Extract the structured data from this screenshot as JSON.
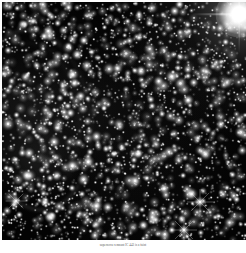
{
  "page": {
    "background_color": "#ffffff",
    "kind": "astronomical-photograph-plate"
  },
  "figure": {
    "alt_title": "Deep optical starfield containing a supernova remnant",
    "plate_background_color": "#030303",
    "star_color": "#ffffff",
    "nebula_color": "#989a98",
    "bright_star_label": "bright-star-with-diffraction-spikes"
  },
  "caption": {
    "text": "supernova remnant IC 443 is a faint"
  },
  "chart_data": {
    "type": "scatter",
    "xlabel": "",
    "ylabel": "",
    "grid": false,
    "legend": "none",
    "xlim": [
      0,
      244
    ],
    "ylim": [
      0,
      238
    ],
    "series": [
      {
        "name": "bright-stars-with-spikes",
        "points": [
          {
            "x": 237,
            "y": 12,
            "size": 9,
            "brightness": 1.0
          },
          {
            "x": 198,
            "y": 200,
            "size": 5,
            "brightness": 0.9
          },
          {
            "x": 182,
            "y": 228,
            "size": 5,
            "brightness": 0.9
          },
          {
            "x": 14,
            "y": 199,
            "size": 4,
            "brightness": 0.85
          },
          {
            "x": 219,
            "y": 60,
            "size": 3,
            "brightness": 0.8
          },
          {
            "x": 96,
            "y": 56,
            "size": 3,
            "brightness": 0.75
          },
          {
            "x": 44,
            "y": 67,
            "size": 3,
            "brightness": 0.75
          },
          {
            "x": 116,
            "y": 169,
            "size": 3,
            "brightness": 0.8
          },
          {
            "x": 36,
            "y": 135,
            "size": 3,
            "brightness": 0.75
          },
          {
            "x": 23,
            "y": 22,
            "size": 3,
            "brightness": 0.7
          }
        ]
      },
      {
        "name": "field-stars",
        "count": 2600,
        "size_range": [
          0.5,
          2.4
        ],
        "brightness_range": [
          0.12,
          1.0
        ]
      }
    ],
    "annotations": [
      {
        "name": "supernova-remnant-arc",
        "cx": 30,
        "cy": 115,
        "rx": 54,
        "ry": 89,
        "description": "faint filamentary shell arc along left portion of field"
      }
    ]
  }
}
